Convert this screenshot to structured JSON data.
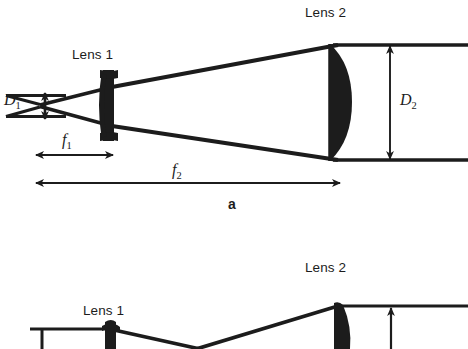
{
  "figure": {
    "type": "optical-ray-diagram",
    "title_visible": false,
    "background_color": "#ffffff",
    "ink_color": "#1c1c1c",
    "panels": [
      {
        "id": "panel-a",
        "caption": "a",
        "description": "Galilean/Keplerian beam expander: small input beam focused through Lens 1 then collimated by Lens 2 into a large output beam",
        "labels": {
          "lens1": "Lens 1",
          "lens2": "Lens 2",
          "input_diameter": "D",
          "input_diameter_sub": "1",
          "output_diameter": "D",
          "output_diameter_sub": "2",
          "focal1": "f",
          "focal1_sub": "1",
          "focal2": "f",
          "focal2_sub": "2"
        }
      },
      {
        "id": "panel-b",
        "caption": "",
        "description": "Second configuration, partially cut off at the bottom edge of the screenshot",
        "labels": {
          "lens1": "Lens 1",
          "lens2": "Lens 2"
        }
      }
    ]
  },
  "panel_a": {
    "lens1_label": "Lens 1",
    "lens2_label": "Lens 2",
    "d1_symbol": "D",
    "d1_subscript": "1",
    "d2_symbol": "D",
    "d2_subscript": "2",
    "f1_symbol": "f",
    "f1_subscript": "1",
    "f2_symbol": "f",
    "f2_subscript": "2",
    "caption": "a"
  },
  "panel_b": {
    "lens1_label": "Lens 1",
    "lens2_label": "Lens 2"
  },
  "geometry": {
    "panel_a": {
      "focus_point": {
        "x": 40,
        "y": 105
      },
      "lens1_x": 110,
      "lens2_x": 338,
      "beam_in_top_y": 96,
      "beam_in_bottom_y": 116,
      "beam_out_top_y": 45,
      "beam_out_bottom_y": 160,
      "f1_arrow": {
        "x1": 35,
        "x2": 113,
        "y": 155
      },
      "f2_arrow": {
        "x1": 35,
        "x2": 340,
        "y": 183
      },
      "d1_arrow": {
        "x": 45,
        "y1": 92,
        "y2": 120
      },
      "d2_arrow": {
        "x": 390,
        "y1": 45,
        "y2": 160
      }
    },
    "panel_b": {
      "lens1_x": 110,
      "lens2_x": 340,
      "ray_y": 307
    }
  }
}
